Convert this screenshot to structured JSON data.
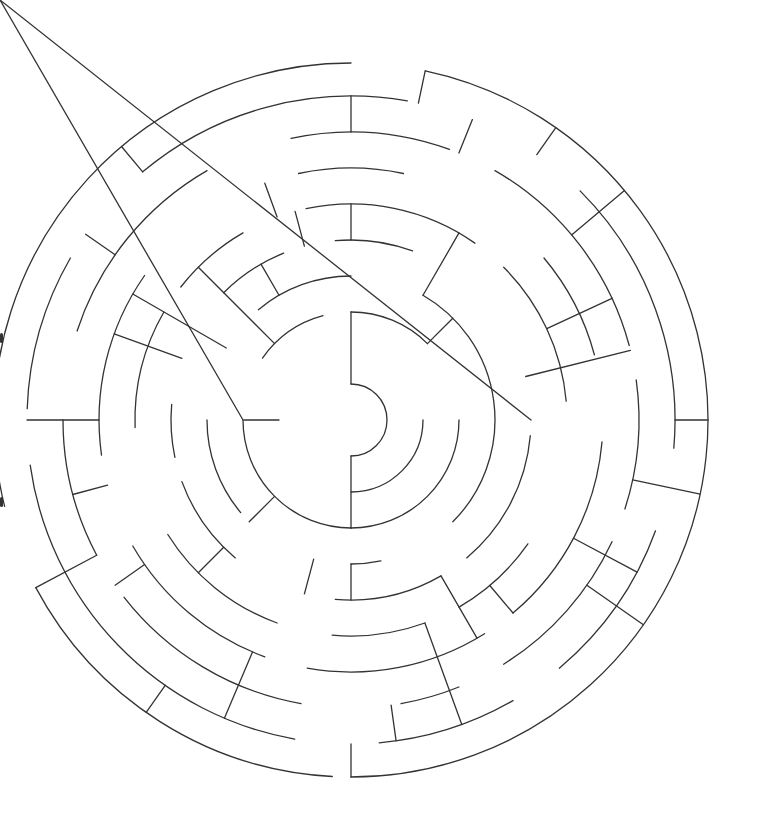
{
  "puzzle": {
    "type": "circular-maze",
    "title": "",
    "rings": 10,
    "colors": {
      "wall": "#333333",
      "background": "#ffffff"
    },
    "entrance": "bottom",
    "center_goal": true
  }
}
